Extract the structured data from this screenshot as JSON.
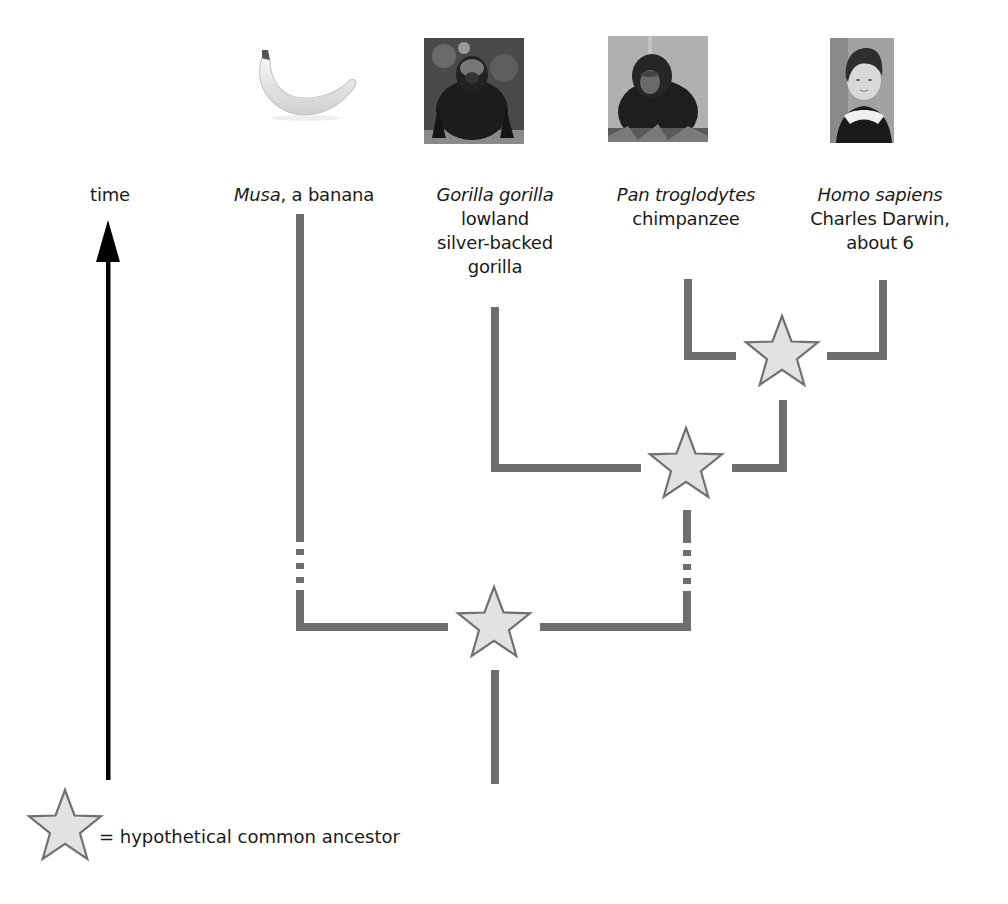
{
  "time_axis": {
    "label": "time",
    "arrow_color": "#000000"
  },
  "taxa": [
    {
      "id": "banana",
      "scientific_name": "Musa",
      "common_name_inline": ", a banana",
      "common_lines": [],
      "image": "banana-photo"
    },
    {
      "id": "gorilla",
      "scientific_name": "Gorilla gorilla",
      "common_name_inline": "",
      "common_lines": [
        "lowland",
        "silver-backed",
        "gorilla"
      ],
      "image": "gorilla-photo"
    },
    {
      "id": "chimpanzee",
      "scientific_name": "Pan troglodytes",
      "common_name_inline": "",
      "common_lines": [
        "chimpanzee"
      ],
      "image": "chimpanzee-photo"
    },
    {
      "id": "human",
      "scientific_name": "Homo sapiens",
      "common_name_inline": "",
      "common_lines": [
        "Charles Darwin,",
        "about 6"
      ],
      "image": "darwin-portrait"
    }
  ],
  "tree": {
    "branch_color": "#6e6e6e",
    "star_fill": "#e2e2e2",
    "star_stroke": "#707070",
    "ancestors": [
      {
        "id": "human-chimp-ancestor",
        "joins": [
          "chimpanzee",
          "human"
        ]
      },
      {
        "id": "great-ape-ancestor",
        "joins": [
          "gorilla",
          "human-chimp-ancestor"
        ]
      },
      {
        "id": "banana-ape-ancestor",
        "joins": [
          "banana",
          "great-ape-ancestor"
        ]
      }
    ],
    "dashed_breaks": [
      "banana-branch",
      "great-ape-ancestor-branch"
    ]
  },
  "legend": {
    "symbol": "star",
    "text": "= hypothetical common ancestor"
  }
}
